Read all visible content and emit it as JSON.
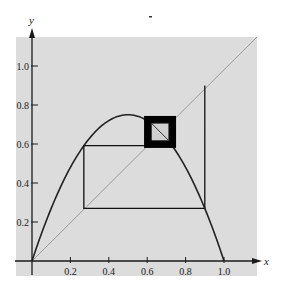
{
  "chart_data": {
    "type": "line",
    "title": "",
    "xlabel": "x",
    "ylabel": "y",
    "xlim": [
      0,
      1.12
    ],
    "ylim": [
      0,
      1.15
    ],
    "x_ticks": [
      "0.2",
      "0.4",
      "0.6",
      "0.8",
      "1.0"
    ],
    "y_ticks": [
      "0.2",
      "0.4",
      "0.6",
      "0.8",
      "1.0"
    ],
    "x_tick_values": [
      0.2,
      0.4,
      0.6,
      0.8,
      1.0
    ],
    "y_tick_values": [
      0.2,
      0.4,
      0.6,
      0.8,
      1.0
    ],
    "grid": false,
    "legend": null,
    "series": [
      {
        "name": "logistic curve",
        "function": "3*x*(1-x)",
        "r": 3.0,
        "x_range": [
          0,
          1
        ],
        "peak": [
          0.5,
          0.75
        ],
        "color": "#222222"
      },
      {
        "name": "diagonal y = x",
        "x": [
          0,
          1.12
        ],
        "y": [
          0,
          1.12
        ],
        "color": "#9a9a9a"
      },
      {
        "name": "cobweb orbit",
        "x0": 0.9,
        "iterations_drawn": 5,
        "fixed_point": 0.667,
        "color": "#111111",
        "points": [
          [
            0.9,
            0.9
          ],
          [
            0.9,
            0.27
          ],
          [
            0.27,
            0.27
          ],
          [
            0.27,
            0.591
          ],
          [
            0.591,
            0.591
          ],
          [
            0.591,
            0.725
          ],
          [
            0.725,
            0.725
          ],
          [
            0.725,
            0.598
          ],
          [
            0.598,
            0.598
          ],
          [
            0.598,
            0.721
          ]
        ]
      }
    ],
    "annotations": [
      "dense spiral box around fixed point (~0.67, ~0.67)"
    ]
  },
  "colors": {
    "panel": "#dcdcdc",
    "axis": "#1a1a1a",
    "curve": "#222222",
    "diagonal": "#9a9a9a",
    "background": "#ffffff"
  },
  "labels": {
    "x_axis": "x",
    "y_axis": "y"
  }
}
